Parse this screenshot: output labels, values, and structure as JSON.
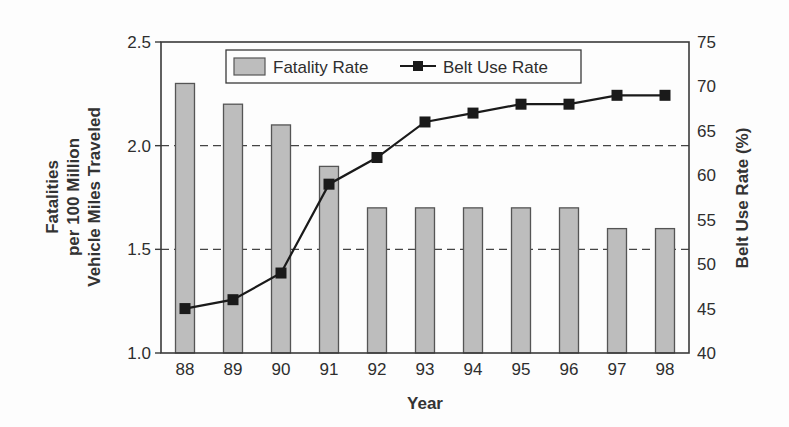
{
  "chart_data": {
    "type": "bar+line",
    "title": "",
    "categories": [
      "88",
      "89",
      "90",
      "91",
      "92",
      "93",
      "94",
      "95",
      "96",
      "97",
      "98"
    ],
    "series": [
      {
        "name": "Fatality Rate",
        "type": "bar",
        "axis": "left",
        "values": [
          2.3,
          2.2,
          2.1,
          1.9,
          1.7,
          1.7,
          1.7,
          1.7,
          1.7,
          1.6,
          1.6
        ],
        "color": "#bdbdbd",
        "edge_color": "#555555"
      },
      {
        "name": "Belt Use Rate",
        "type": "line",
        "axis": "right",
        "marker": "square",
        "values": [
          45,
          46,
          49,
          59,
          62,
          66,
          67,
          68,
          68,
          69,
          69
        ],
        "color": "#1a1a1a"
      }
    ],
    "xlabel": "Year",
    "ylabel_left": "Fatalities per 100 Million Vehicle Miles Traveled",
    "ylabel_left_lines": [
      "Fatalities",
      "per 100 Million",
      "Vehicle Miles Traveled"
    ],
    "ylabel_right": "Belt Use Rate (%)",
    "ylim_left": [
      1.0,
      2.5
    ],
    "yticks_left": [
      "1.0",
      "1.5",
      "2.0",
      "2.5"
    ],
    "ylim_right": [
      40,
      75
    ],
    "yticks_right": [
      "40",
      "45",
      "50",
      "55",
      "60",
      "65",
      "70",
      "75"
    ],
    "gridlines": {
      "style": "dashed",
      "at_left_values": [
        1.5,
        2.0
      ]
    },
    "legend": {
      "position": "top-center-inside",
      "entries": [
        "Fatality Rate",
        "Belt Use Rate"
      ]
    }
  }
}
